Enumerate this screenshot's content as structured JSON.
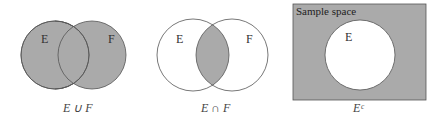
{
  "colors": {
    "fill": "#aaaaaa",
    "stroke": "#555555",
    "background": "#ffffff"
  },
  "diagrams": [
    {
      "name": "union",
      "labels": {
        "left": "E",
        "right": "F"
      },
      "caption": "E ∪ F"
    },
    {
      "name": "intersection",
      "labels": {
        "left": "E",
        "right": "F"
      },
      "caption": "E ∩ F"
    },
    {
      "name": "complement",
      "box_label": "Sample space",
      "labels": {
        "circle": "E"
      },
      "caption": "Eᶜ"
    }
  ]
}
